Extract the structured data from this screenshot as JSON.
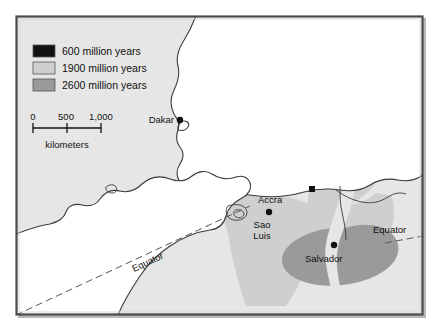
{
  "figure": {
    "kind": "geologic-age-map",
    "width": 446,
    "height": 333,
    "background_color": "#ffffff",
    "ocean_color": "#e8e8e8",
    "land_color": "#ffffff",
    "border_color": "#555555",
    "coastline_color": "#333333"
  },
  "legend": {
    "items": [
      {
        "label": "600 million years",
        "color": "#111111",
        "swatch_name": "swatch-600"
      },
      {
        "label": "1900 million years",
        "color": "#cfcfcf",
        "swatch_name": "swatch-1900"
      },
      {
        "label": "2600 million years",
        "color": "#9a9a9a",
        "swatch_name": "swatch-2600"
      }
    ]
  },
  "scale_bar": {
    "ticks": [
      "0",
      "500",
      "1,000"
    ],
    "units_label": "kilometers"
  },
  "cities": [
    {
      "name": "Dakar",
      "marker": "circle",
      "label_side": "left"
    },
    {
      "name": "Accra",
      "marker": "square",
      "label_side": "below-left"
    },
    {
      "name": "Sao Luis",
      "marker": "circle",
      "label_side": "below",
      "line1": "Sao",
      "line2": "Luis"
    },
    {
      "name": "Salvador",
      "marker": "circle",
      "label_side": "below-left"
    }
  ],
  "annotations": {
    "equator_left": "Equator",
    "equator_right": "Equator"
  }
}
